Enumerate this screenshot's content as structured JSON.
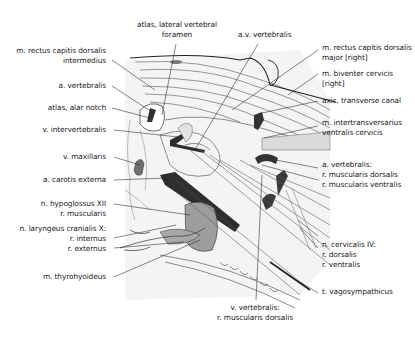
{
  "figure": {
    "type": "anatomical diagram"
  },
  "labels": {
    "atlas_lateral_vertebral_foramen": {
      "lines": [
        "atlas, lateral vertebral",
        "foramen"
      ]
    },
    "av_vertebralis": {
      "lines": [
        "a.v. vertebralis"
      ]
    },
    "m_rectus_capitis_dorsalis_intermedius": {
      "lines": [
        "m. rectus capitis dorsalis",
        "intermedius"
      ]
    },
    "a_vertebralis": {
      "lines": [
        "a. vertebralis"
      ]
    },
    "atlas_alar_notch": {
      "lines": [
        "atlas, alar notch"
      ]
    },
    "v_intervertebralis": {
      "lines": [
        "v. intervertebralis"
      ]
    },
    "v_maxillaris": {
      "lines": [
        "v. maxillaris"
      ]
    },
    "a_carotis_externa": {
      "lines": [
        "a. carotis externa"
      ]
    },
    "n_hypoglossus": {
      "lines": [
        "n. hypoglossus XII",
        "r. muscularis"
      ]
    },
    "n_laryngeus": {
      "lines": [
        "n. laryngeus cranialis X:",
        "r. internus",
        "r. externus"
      ]
    },
    "m_thyrohyoideus": {
      "lines": [
        "m. thyrohyoideus"
      ]
    },
    "m_rectus_capitis_dorsalis_major": {
      "lines": [
        "m. rectus capitis dorsalis",
        "major [right]"
      ]
    },
    "m_biventer_cervicis": {
      "lines": [
        "m. biventer cervicis",
        "[right]"
      ]
    },
    "axis_transverse_canal": {
      "lines": [
        "axis, transverse canal"
      ]
    },
    "m_intertransversarius": {
      "lines": [
        "m. intertransversarius",
        "ventralis cervicis"
      ]
    },
    "a_vertebralis_rami": {
      "lines": [
        "a. vertebralis:",
        "r. muscularis dorsalis",
        "r. muscularis ventralis"
      ]
    },
    "n_cervicalis_iv": {
      "lines": [
        "n. cervicalis IV:",
        "r. dorsalis",
        "r. ventralis"
      ]
    },
    "t_vagosympathicus": {
      "lines": [
        "t. vagosympathicus"
      ]
    },
    "v_vertebralis": {
      "lines": [
        "v. vertebralis:",
        "r. muscularis dorsalis"
      ]
    }
  },
  "colors": {
    "line": "#333333",
    "vessel_dark": "#3a3a3a",
    "gland_gray": "#9a9a9a",
    "muscle_light": "#d6d6d6",
    "shadow_bg": "#f2f2f2"
  }
}
